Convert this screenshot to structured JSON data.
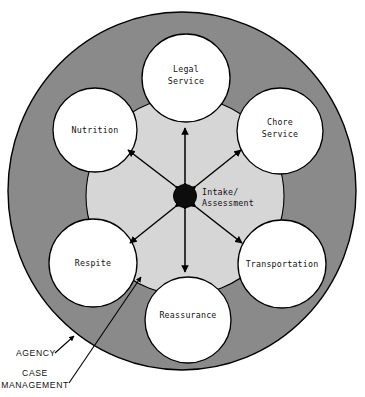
{
  "diagram": {
    "colors": {
      "outer_ring_fill": "#8a8a8a",
      "inner_disc_fill": "#d6d6d6",
      "service_circle_fill": "#ffffff",
      "hub_fill": "#0d0d0d",
      "stroke": "#000000",
      "text": "#111111",
      "page_background": "#ffffff"
    },
    "hub": {
      "label_line1": "Intake/",
      "label_line2": "Assessment"
    },
    "services": [
      {
        "id": "legal-service",
        "label_line1": "Legal",
        "label_line2": "Service"
      },
      {
        "id": "chore-service",
        "label_line1": "Chore",
        "label_line2": "Service"
      },
      {
        "id": "transportation",
        "label_line1": "Transportation",
        "label_line2": ""
      },
      {
        "id": "reassurance",
        "label_line1": "Reassurance",
        "label_line2": ""
      },
      {
        "id": "respite",
        "label_line1": "Respite",
        "label_line2": ""
      },
      {
        "id": "nutrition",
        "label_line1": "Nutrition",
        "label_line2": ""
      }
    ],
    "callouts": [
      {
        "id": "agency",
        "label_line1": "AGENCY",
        "label_line2": ""
      },
      {
        "id": "case-management",
        "label_line1": "CASE",
        "label_line2": "MANAGEMENT"
      }
    ]
  }
}
